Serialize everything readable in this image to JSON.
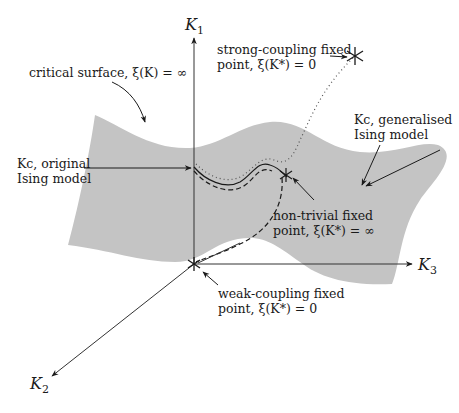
{
  "diagram": {
    "type": "renormalization-group-flow-diagram",
    "colors": {
      "surface": "#c4c4c4",
      "ink": "#1a1a1a",
      "background": "#ffffff"
    },
    "axes": {
      "k1": {
        "symbol": "K",
        "sub": "1"
      },
      "k2": {
        "symbol": "K",
        "sub": "2"
      },
      "k3": {
        "symbol": "K",
        "sub": "3"
      }
    },
    "labels": {
      "critical_surface": "critical surface, ξ(K) = ∞",
      "strong_coupling_line1": "strong-coupling fixed",
      "strong_coupling_line2": "point, ξ(K*) = 0",
      "kc_original_line1": "Kc, original",
      "kc_original_line2": "Ising model",
      "kc_generalised_line1": "Kc, generalised",
      "kc_generalised_line2": "Ising model",
      "nontrivial_line1": "non-trivial fixed",
      "nontrivial_line2": "point, ξ(K*) = ∞",
      "weak_coupling_line1": "weak-coupling fixed",
      "weak_coupling_line2": "point, ξ(K*) = 0"
    },
    "fixed_points": [
      {
        "name": "strong-coupling",
        "symbol": "∗"
      },
      {
        "name": "non-trivial",
        "symbol": "∗"
      },
      {
        "name": "weak-coupling",
        "symbol": "∗"
      }
    ],
    "curves": [
      {
        "name": "original-ising-critical-line",
        "style": "solid"
      },
      {
        "name": "generalised-ising-critical-line",
        "style": "dashed"
      },
      {
        "name": "flow-to-strong-coupling",
        "style": "dotted"
      }
    ]
  }
}
